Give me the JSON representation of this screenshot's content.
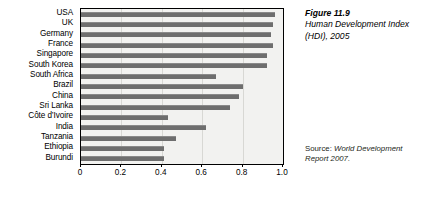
{
  "chart_data": {
    "type": "bar",
    "orientation": "horizontal",
    "title": "Human Development Index (HDI), 2005",
    "figure_number": "Figure 11.9",
    "xlabel": "",
    "ylabel": "",
    "xlim": [
      0,
      1.0
    ],
    "xticks": [
      "0",
      "0.2",
      "0.4",
      "0.6",
      "0.8",
      "1.0"
    ],
    "xtick_values": [
      0,
      0.2,
      0.4,
      0.6,
      0.8,
      1.0
    ],
    "grid": true,
    "legend": "none",
    "bar_color": "#6e6e6e",
    "plot_background": "#f2f2f0",
    "categories": [
      "USA",
      "UK",
      "Germany",
      "France",
      "Singapore",
      "South Korea",
      "South Africa",
      "Brazil",
      "China",
      "Sri Lanka",
      "Côte d’Ivoire",
      "India",
      "Tanzania",
      "Ethiopia",
      "Burundi"
    ],
    "values": [
      0.96,
      0.95,
      0.94,
      0.95,
      0.92,
      0.92,
      0.67,
      0.8,
      0.78,
      0.74,
      0.43,
      0.62,
      0.47,
      0.41,
      0.41
    ]
  },
  "caption": {
    "figure_number": "Figure 11.9",
    "title": "Human Development Index (HDI), 2005"
  },
  "source": {
    "label": "Source: ",
    "text": "World Development Report 2007."
  }
}
